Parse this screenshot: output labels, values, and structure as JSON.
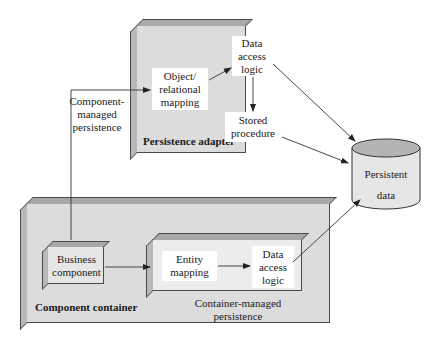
{
  "persistence_adapter": {
    "title": "Persistence adapter",
    "object_relational_mapping": "Object/ relational mapping",
    "data_access_logic": "Data access logic",
    "stored_procedure": "Stored procedure"
  },
  "component_managed_label": "Component-managed persistence",
  "component_managed_lines": [
    "Component-",
    "managed",
    "persistence"
  ],
  "persistent_data": {
    "lines": [
      "Persistent",
      "data"
    ]
  },
  "component_container": {
    "title": "Component container",
    "business_component": "Business component",
    "container_managed": {
      "label_lines": [
        "Container-managed",
        "persistence"
      ],
      "entity_mapping": "Entity mapping",
      "data_access_logic": "Data access logic"
    }
  },
  "colors": {
    "panel_fill": "#dcdcdc",
    "panel_edge": "#a8a8a8",
    "box_fill": "#ffffff",
    "line": "#333333"
  }
}
